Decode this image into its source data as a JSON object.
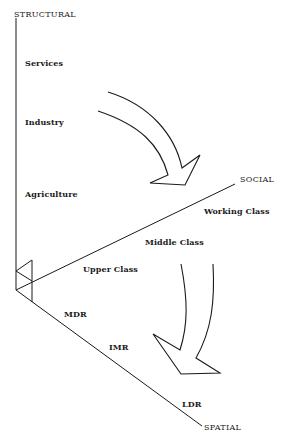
{
  "diagram": {
    "axes": {
      "structural": "STRUCTURAL",
      "social": "SOCIAL",
      "spatial": "SPATIAL"
    },
    "structural_labels": [
      "Services",
      "Industry",
      "Agriculture"
    ],
    "social_labels": [
      "Working Class",
      "Middle Class",
      "Upper Class"
    ],
    "spatial_labels": [
      "MDR",
      "IMR",
      "LDR"
    ],
    "arrows": [
      {
        "from": "structural",
        "to": "social",
        "direction": "down-right"
      },
      {
        "from": "social",
        "to": "spatial",
        "direction": "down"
      }
    ],
    "colors": {
      "ink": "#1a1a1a",
      "background": "#ffffff"
    }
  }
}
